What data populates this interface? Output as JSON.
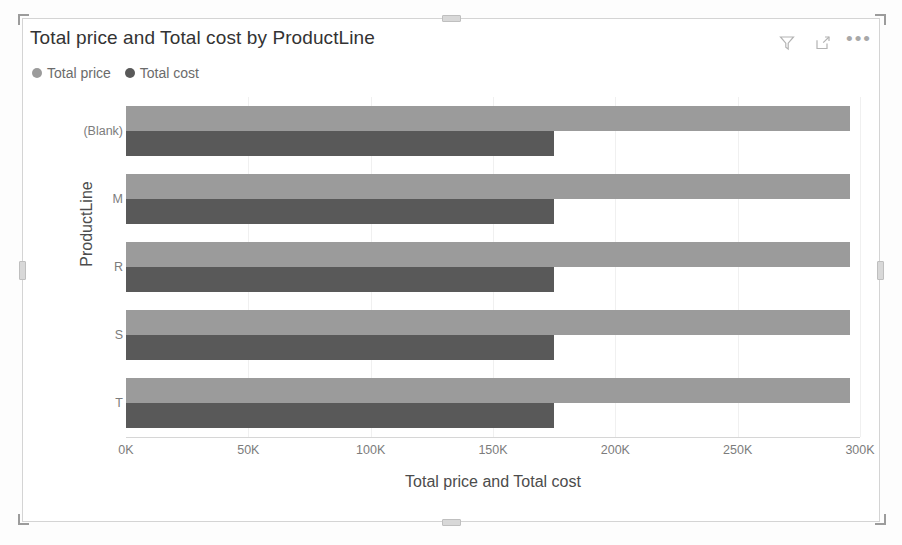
{
  "visual": {
    "title": "Total price and Total cost by ProductLine",
    "actions": [
      {
        "name": "filter-icon",
        "label": "Filters"
      },
      {
        "name": "focus-mode-icon",
        "label": "Focus mode"
      },
      {
        "name": "more-options-icon",
        "label": "More options"
      }
    ],
    "more_options_glyph": "•••"
  },
  "legend": {
    "position": "top-left",
    "items": [
      {
        "label": "Total price",
        "color": "#9b9b9b"
      },
      {
        "label": "Total cost",
        "color": "#595959"
      }
    ]
  },
  "chart_data": {
    "type": "bar",
    "orientation": "horizontal",
    "title": "Total price and Total cost by ProductLine",
    "xlabel": "Total price and Total cost",
    "ylabel": "ProductLine",
    "categories": [
      "(Blank)",
      "M",
      "R",
      "S",
      "T"
    ],
    "series": [
      {
        "name": "Total price",
        "color": "#9b9b9b",
        "values": [
          296000,
          296000,
          296000,
          296000,
          296000
        ]
      },
      {
        "name": "Total cost",
        "color": "#595959",
        "values": [
          175000,
          175000,
          175000,
          175000,
          175000
        ]
      }
    ],
    "xlim": [
      0,
      300000
    ],
    "x_ticks": [
      0,
      50000,
      100000,
      150000,
      200000,
      250000,
      300000
    ],
    "x_tick_labels": [
      "0K",
      "50K",
      "100K",
      "150K",
      "200K",
      "250K",
      "300K"
    ],
    "grid": true,
    "legend_position": "top"
  }
}
